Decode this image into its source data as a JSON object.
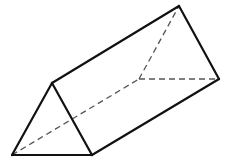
{
  "diagram": {
    "type": "triangular-prism",
    "colors": {
      "background": "#ffffff",
      "visible_edge": "#111111",
      "hidden_edge": "#555555"
    },
    "vertices": {
      "front_apex": [
        52,
        83
      ],
      "front_left": [
        12,
        155
      ],
      "front_right": [
        92,
        155
      ],
      "back_apex": [
        179,
        6
      ],
      "back_left": [
        139,
        79
      ],
      "back_right": [
        219,
        79
      ]
    },
    "visible_edges": [
      [
        "front_apex",
        "front_left"
      ],
      [
        "front_left",
        "front_right"
      ],
      [
        "front_right",
        "front_apex"
      ],
      [
        "front_apex",
        "back_apex"
      ],
      [
        "front_right",
        "back_right"
      ],
      [
        "back_apex",
        "back_right"
      ]
    ],
    "hidden_edges": [
      [
        "front_left",
        "back_left"
      ],
      [
        "back_left",
        "back_apex"
      ],
      [
        "back_left",
        "back_right"
      ]
    ]
  }
}
